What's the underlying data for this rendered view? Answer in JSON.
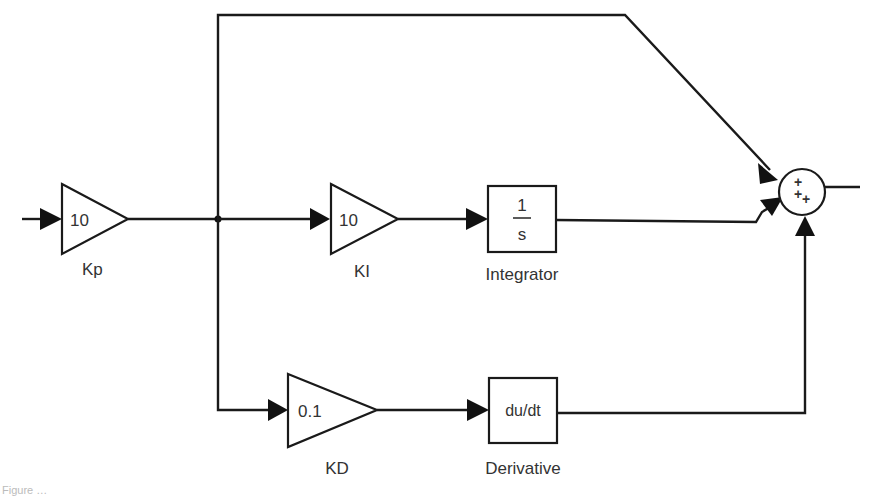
{
  "diagram": {
    "type": "PID controller block diagram",
    "blocks": {
      "kp": {
        "value": "10",
        "label": "Kp"
      },
      "ki": {
        "value": "10",
        "label": "KI"
      },
      "integrator": {
        "numerator": "1",
        "denominator": "s",
        "label": "Integrator"
      },
      "kd": {
        "value": "0.1",
        "label": "KD"
      },
      "derivative": {
        "value": "du/dt",
        "label": "Derivative"
      },
      "sum": {
        "signs": [
          "+",
          "+",
          "+"
        ]
      }
    },
    "caption": "Figure …"
  }
}
